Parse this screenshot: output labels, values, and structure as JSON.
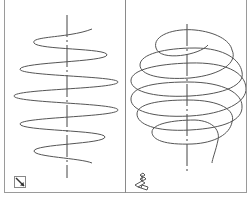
{
  "viewports": [
    {
      "id": "left",
      "view": "front-elevation",
      "content": "helix side view (sine-like projection)",
      "ucs_icon": "ucs-2d-icon",
      "colors": {
        "stroke": "#555555",
        "axis": "#444444"
      }
    },
    {
      "id": "right",
      "view": "isometric",
      "content": "helix 3D wireframe",
      "ucs_icon": "ucs-3d-icon",
      "colors": {
        "stroke": "#555555",
        "axis": "#444444"
      }
    }
  ],
  "colors": {
    "background": "#ffffff",
    "border": "#9a9a9a"
  }
}
